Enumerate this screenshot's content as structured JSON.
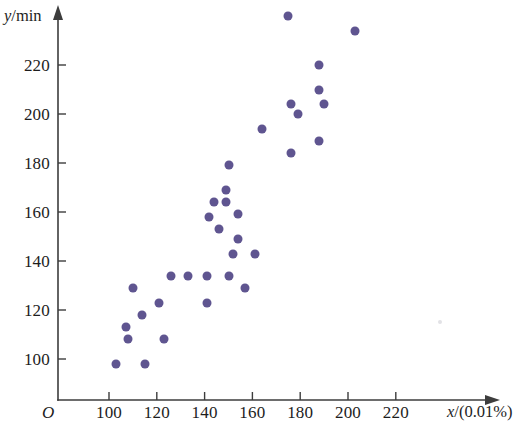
{
  "figure": {
    "width": 523,
    "height": 435,
    "background": "#ffffff",
    "origin_label": "O",
    "marker_color": "#5f5590",
    "axis_color": "#3d3d3d",
    "text_color": "#1d1d1d"
  },
  "axis_titles": {
    "y": "y/min",
    "y_variable": "y",
    "y_unit": "/min",
    "x": "x/(0.01%)",
    "x_variable": "x",
    "x_unit": "/(0.01%)"
  },
  "ticks": {
    "x_labels": [
      "100",
      "120",
      "140",
      "160",
      "180",
      "200",
      "220"
    ],
    "y_labels": [
      "100",
      "120",
      "140",
      "160",
      "180",
      "200",
      "220"
    ]
  },
  "geometry": {
    "x_axis_y_px": 400,
    "y_axis_x_px": 58,
    "x_origin_px": 109,
    "y_origin_px": 359,
    "x_scale_px_per_unit": 2.39,
    "y_scale_px_per_unit": 2.45,
    "x_tick_values": [
      100,
      120,
      140,
      160,
      180,
      200,
      220
    ],
    "y_tick_values": [
      100,
      120,
      140,
      160,
      180,
      200,
      220
    ],
    "x_axis_end_px": 500,
    "y_axis_top_px": 10
  },
  "chart_data": {
    "type": "scatter",
    "title": "",
    "xlabel": "x/(0.01%)",
    "ylabel": "y/min",
    "grid": false,
    "legend": null,
    "xlim": [
      90,
      232
    ],
    "ylim": [
      88,
      248
    ],
    "xticks": [
      100,
      120,
      140,
      160,
      180,
      200,
      220
    ],
    "yticks": [
      100,
      120,
      140,
      160,
      180,
      200,
      220
    ],
    "marker": "circle",
    "marker_color": "#5f5590",
    "n_points": 34,
    "points": [
      [
        103,
        98
      ],
      [
        107,
        113
      ],
      [
        108,
        108
      ],
      [
        110,
        129
      ],
      [
        114,
        118
      ],
      [
        115,
        98
      ],
      [
        121,
        123
      ],
      [
        123,
        108
      ],
      [
        126,
        134
      ],
      [
        133,
        134
      ],
      [
        141,
        134
      ],
      [
        141,
        123
      ],
      [
        142,
        158
      ],
      [
        144,
        164
      ],
      [
        146,
        153
      ],
      [
        149,
        169
      ],
      [
        149,
        164
      ],
      [
        150,
        179
      ],
      [
        150,
        134
      ],
      [
        152,
        143
      ],
      [
        154,
        159
      ],
      [
        154,
        149
      ],
      [
        157,
        129
      ],
      [
        161,
        143
      ],
      [
        164,
        194
      ],
      [
        175,
        240
      ],
      [
        176,
        204
      ],
      [
        176,
        184
      ],
      [
        179,
        200
      ],
      [
        188,
        220
      ],
      [
        188,
        210
      ],
      [
        188,
        189
      ],
      [
        190,
        204
      ],
      [
        203,
        234
      ]
    ]
  },
  "artifacts": [
    {
      "name": "faint-speck",
      "x_px": 440,
      "y_px": 322
    }
  ]
}
